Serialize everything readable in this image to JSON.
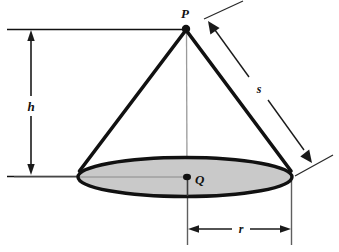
{
  "figure": {
    "background_color": "#ffffff",
    "stroke_color": "#111111",
    "thin_stroke_color": "#5a5a5a",
    "base_fill_color": "#c8c8c8",
    "labels": {
      "apex": "P",
      "center": "Q",
      "height": "h",
      "slant": "s",
      "radius": "r"
    },
    "geometry": {
      "apex_point": {
        "x": 186,
        "y": 29
      },
      "center_point": {
        "x": 187,
        "y": 177
      },
      "base_ellipse": {
        "cx": 185,
        "cy": 177,
        "rx": 107,
        "ry": 19.5
      },
      "height_dimension": {
        "x": 31,
        "y_top": 30,
        "y_bottom": 175
      },
      "radius_dimension": {
        "y": 229,
        "x_left": 188,
        "x_right": 291
      },
      "slant_dimension": {
        "x1": 208,
        "y1": 21,
        "x2": 311,
        "y2": 162
      }
    },
    "elements": [
      {
        "name": "apex-point-marker",
        "label": "P"
      },
      {
        "name": "center-point-marker",
        "label": "Q"
      },
      {
        "name": "height-dimension-arrow",
        "label": "h"
      },
      {
        "name": "slant-dimension-arrow",
        "label": "s"
      },
      {
        "name": "radius-dimension-arrow",
        "label": "r"
      },
      {
        "name": "base-ellipse",
        "label": ""
      },
      {
        "name": "cone-left-edge",
        "label": ""
      },
      {
        "name": "cone-right-edge",
        "label": ""
      },
      {
        "name": "axis-line",
        "label": ""
      }
    ]
  }
}
